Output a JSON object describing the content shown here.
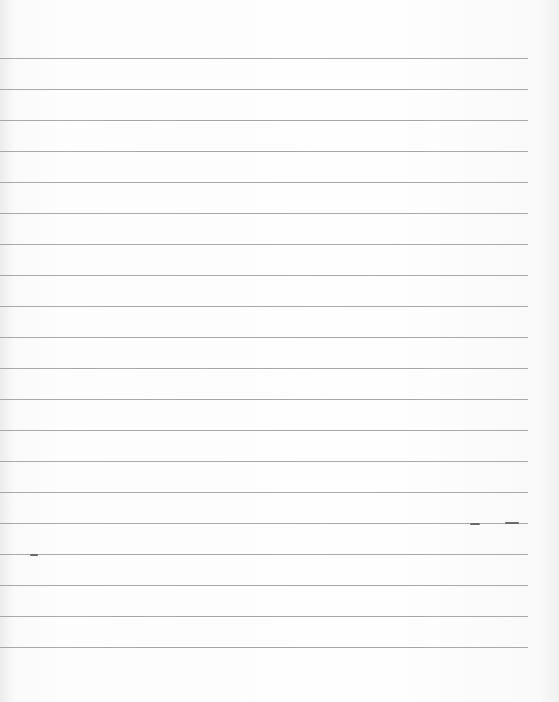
{
  "paper": {
    "description": "Blank lined notebook paper",
    "line_count": 20,
    "line_start_y": 58,
    "line_spacing": 31,
    "line_width": 528,
    "line_color": "#9a9a9a",
    "background_color": "#fdfdfd"
  }
}
